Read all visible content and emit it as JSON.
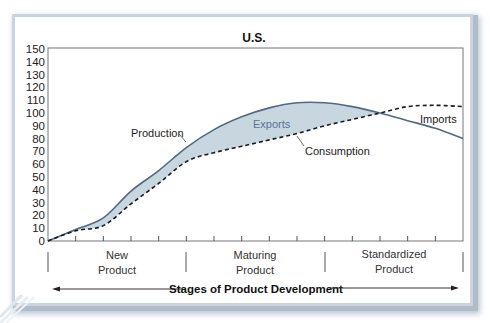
{
  "chart_data": {
    "type": "line",
    "title": "U.S.",
    "xlabel": "Stages of Product Development",
    "ylabel": "",
    "ylim": [
      0,
      150
    ],
    "yticks": [
      0,
      10,
      20,
      30,
      40,
      50,
      60,
      70,
      80,
      90,
      100,
      110,
      120,
      130,
      140,
      150
    ],
    "x": [
      0,
      1,
      2,
      3,
      4,
      5,
      6,
      7,
      8,
      9,
      10,
      11,
      12,
      13,
      14,
      15
    ],
    "stages": [
      "New Product",
      "Maturing Product",
      "Standardized Product"
    ],
    "series": [
      {
        "name": "Production",
        "style": "solid",
        "color": "#4f6a86",
        "values": [
          0,
          9,
          18,
          39,
          55,
          73,
          87,
          97,
          104,
          108,
          108,
          105,
          100,
          94,
          88,
          80
        ]
      },
      {
        "name": "Consumption",
        "style": "dashed",
        "color": "#1a1a1a",
        "values": [
          0,
          8,
          12,
          29,
          45,
          62,
          69,
          74,
          79,
          84,
          90,
          95,
          100,
          105,
          106,
          105
        ]
      }
    ],
    "annotations": [
      {
        "text": "Production",
        "target": "Production"
      },
      {
        "text": "Consumption",
        "target": "Consumption"
      },
      {
        "text": "Exports",
        "region": "Production above Consumption",
        "fill": "#c8d6e0"
      },
      {
        "text": "Imports",
        "region": "Consumption above Production"
      }
    ],
    "grid": false,
    "legend": "none"
  },
  "labels": {
    "title": "U.S.",
    "production": "Production",
    "consumption": "Consumption",
    "exports": "Exports",
    "imports": "Imports",
    "stage_new_1": "New",
    "stage_new_2": "Product",
    "stage_mat_1": "Maturing",
    "stage_mat_2": "Product",
    "stage_std_1": "Standardized",
    "stage_std_2": "Product",
    "xaxis": "Stages of Product Development"
  },
  "colors": {
    "fill": "#c8d6e0",
    "production": "#4f6a86",
    "consumption": "#1a1a1a",
    "exports_text": "#5a7492"
  }
}
